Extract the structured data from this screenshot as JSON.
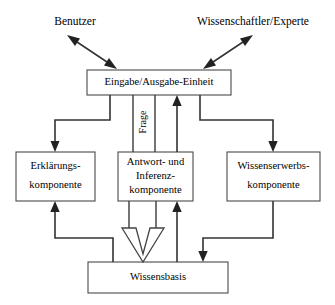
{
  "diagram": {
    "title_text": "",
    "background_color": "#ffffff",
    "line_color": "#333333",
    "box_border_color": "#4a4a4a",
    "text_color": "#000000",
    "actors": [
      {
        "id": "benutzer",
        "label": "Benutzer",
        "x": 75,
        "y": 22
      },
      {
        "id": "wissenschaftler",
        "label": "Wissenschaftler/Experte",
        "x": 253,
        "y": 22
      }
    ],
    "boxes": [
      {
        "id": "eingabe-ausgabe-einheit",
        "lines": [
          "Eingabe/Ausgabe-Einheit"
        ],
        "x": 87,
        "y": 70,
        "w": 144,
        "h": 25
      },
      {
        "id": "erklaerungskomponente",
        "lines": [
          "Erklärungs-",
          "komponente"
        ],
        "x": 16,
        "y": 152,
        "w": 79,
        "h": 49
      },
      {
        "id": "antwort-und-inferenzkomponente",
        "lines": [
          "Antwort- und",
          "Inferenz-",
          "komponente"
        ],
        "x": 118,
        "y": 152,
        "w": 75,
        "h": 49
      },
      {
        "id": "wissenserwerbskomponente",
        "lines": [
          "Wissenserwerbs-",
          "komponente"
        ],
        "x": 227,
        "y": 152,
        "w": 93,
        "h": 49
      },
      {
        "id": "wissensbasis",
        "lines": [
          "Wissensbasis"
        ],
        "x": 88,
        "y": 262,
        "w": 140,
        "h": 31
      }
    ],
    "edge_labels": [
      {
        "id": "frage",
        "label": "Frage",
        "x": 139,
        "y": 122,
        "rotation": -90
      }
    ],
    "connections": [
      {
        "id": "benutzer-to-eingabe",
        "type": "double-arrow",
        "from": "benutzer",
        "to": "eingabe-ausgabe-einheit"
      },
      {
        "id": "wissenschaftler-to-eingabe",
        "type": "double-arrow",
        "from": "wissenschaftler",
        "to": "eingabe-ausgabe-einheit"
      },
      {
        "id": "eingabe-to-erklaerung",
        "type": "elbow-arrow",
        "from": "eingabe-ausgabe-einheit",
        "to": "erklaerungskomponente"
      },
      {
        "id": "eingabe-to-inferenz-frage",
        "type": "line",
        "from": "eingabe-ausgabe-einheit",
        "to": "antwort-und-inferenzkomponente"
      },
      {
        "id": "inferenz-to-eingabe",
        "type": "arrow-up",
        "from": "antwort-und-inferenzkomponente",
        "to": "eingabe-ausgabe-einheit"
      },
      {
        "id": "eingabe-to-wissenserwerb",
        "type": "elbow-arrow",
        "from": "eingabe-ausgabe-einheit",
        "to": "wissenserwerbskomponente"
      },
      {
        "id": "wissensbasis-to-erklaerung",
        "type": "elbow-arrow-up",
        "from": "wissensbasis",
        "to": "erklaerungskomponente"
      },
      {
        "id": "inferenz-to-wissensbasis",
        "type": "hollow-arrow-down",
        "from": "antwort-und-inferenzkomponente",
        "to": "wissensbasis"
      },
      {
        "id": "wissensbasis-to-inferenz",
        "type": "arrow-up",
        "from": "wissensbasis",
        "to": "antwort-und-inferenzkomponente"
      },
      {
        "id": "wissenserwerb-to-wissensbasis",
        "type": "elbow-arrow-down",
        "from": "wissenserwerbskomponente",
        "to": "wissensbasis"
      }
    ]
  }
}
